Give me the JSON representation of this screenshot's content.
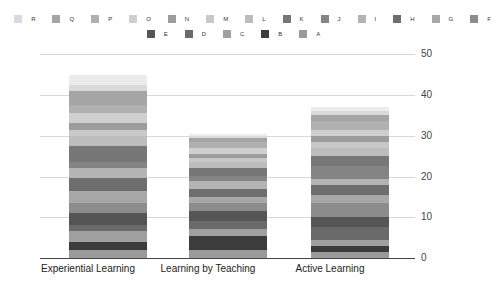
{
  "chart_data": {
    "type": "bar",
    "stacked": true,
    "title": "",
    "xlabel": "",
    "ylabel": "",
    "ylim": [
      0,
      50
    ],
    "yticks": [
      "0",
      "10",
      "20",
      "30",
      "40",
      "50"
    ],
    "grid": true,
    "legend_position": "top",
    "categories": [
      "Experiential Learning",
      "Learning by Teaching",
      "Active Learning"
    ],
    "series": [
      {
        "name": "A",
        "color": "#9a9a9a",
        "values": [
          2.0,
          2.0,
          1.5
        ]
      },
      {
        "name": "B",
        "color": "#3c3c3c",
        "values": [
          2.0,
          3.5,
          1.5
        ]
      },
      {
        "name": "C",
        "color": "#a0a0a0",
        "values": [
          2.5,
          1.5,
          1.5
        ]
      },
      {
        "name": "D",
        "color": "#6a6a6a",
        "values": [
          1.5,
          2.0,
          3.0
        ]
      },
      {
        "name": "E",
        "color": "#555555",
        "values": [
          3.0,
          2.5,
          2.5
        ]
      },
      {
        "name": "F",
        "color": "#8c8c8c",
        "values": [
          2.5,
          2.0,
          3.5
        ]
      },
      {
        "name": "G",
        "color": "#a8a8a8",
        "values": [
          3.0,
          1.5,
          2.0
        ]
      },
      {
        "name": "H",
        "color": "#6e6e6e",
        "values": [
          3.0,
          2.0,
          2.5
        ]
      },
      {
        "name": "I",
        "color": "#b4b4b4",
        "values": [
          2.5,
          2.0,
          1.5
        ]
      },
      {
        "name": "J",
        "color": "#848484",
        "values": [
          1.5,
          1.0,
          3.0
        ]
      },
      {
        "name": "K",
        "color": "#777777",
        "values": [
          4.0,
          2.0,
          2.5
        ]
      },
      {
        "name": "L",
        "color": "#bdbdbd",
        "values": [
          2.5,
          1.5,
          2.0
        ]
      },
      {
        "name": "M",
        "color": "#c8c8c8",
        "values": [
          1.5,
          1.0,
          1.5
        ]
      },
      {
        "name": "N",
        "color": "#9c9c9c",
        "values": [
          1.5,
          1.0,
          1.5
        ]
      },
      {
        "name": "O",
        "color": "#cfcfcf",
        "values": [
          2.5,
          1.5,
          1.5
        ]
      },
      {
        "name": "P",
        "color": "#b0b0b0",
        "values": [
          2.0,
          1.5,
          2.0
        ]
      },
      {
        "name": "Q",
        "color": "#a5a5a5",
        "values": [
          3.5,
          1.0,
          1.5
        ]
      },
      {
        "name": "R",
        "color": "#dadada",
        "values": [
          1.5,
          0.5,
          1.0
        ]
      },
      {
        "name": "S",
        "color": "#ececec",
        "values": [
          2.5,
          0.5,
          1.0
        ]
      }
    ],
    "totals": [
      45.0,
      31.0,
      37.0
    ]
  },
  "legend": {
    "row1": [
      "S",
      "R",
      "Q",
      "P",
      "O",
      "N",
      "M",
      "L",
      "K",
      "J",
      "I",
      "H",
      "G",
      "F"
    ],
    "row2": [
      "E",
      "D",
      "C",
      "B",
      "A"
    ]
  }
}
